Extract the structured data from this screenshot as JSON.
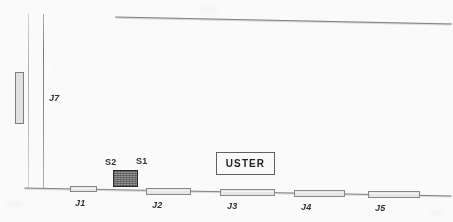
{
  "diagram": {
    "type": "schematic-line-drawing",
    "media": "scanned-fax-document",
    "background_color": "#fefefe",
    "stroke_color": "#3a3a3a",
    "bar_fill_color": "#e9e9e9",
    "dark_box_fill_color": "#7e7e7e",
    "callout": {
      "label": "USTER",
      "x": 216,
      "y": 152,
      "width": 59,
      "height": 23
    },
    "baseline": {
      "name": "ground-baseline",
      "x1": 24,
      "y1": 188,
      "x2": 452,
      "y2": 196
    },
    "top_rule": {
      "name": "upper-boundary-line",
      "x1": 115,
      "y1": 17,
      "x2": 452,
      "y2": 24
    },
    "vertical_lines": [
      {
        "name": "left-vertical-faint",
        "x": 28,
        "y1": 14,
        "y2": 188,
        "weight": "faint"
      },
      {
        "name": "left-vertical-main",
        "x": 43,
        "y1": 14,
        "y2": 188,
        "weight": "main"
      }
    ],
    "vertical_bars": [
      {
        "label": "J7-riser",
        "x": 15,
        "y": 72,
        "width": 9,
        "height": 52
      }
    ],
    "horizontal_bars": [
      {
        "label": "J1",
        "x": 70,
        "y": 186,
        "width": 27,
        "height": 6
      },
      {
        "label": "J2",
        "x": 146,
        "y": 188,
        "width": 45,
        "height": 7
      },
      {
        "label": "J3",
        "x": 220,
        "y": 189,
        "width": 55,
        "height": 7
      },
      {
        "label": "J4",
        "x": 294,
        "y": 190,
        "width": 51,
        "height": 7
      },
      {
        "label": "J5",
        "x": 368,
        "y": 191,
        "width": 52,
        "height": 7
      }
    ],
    "dark_box": {
      "name": "sensor-block",
      "x": 113,
      "y": 170,
      "width": 25,
      "height": 17
    },
    "labels": [
      {
        "id": "label-j7",
        "text": "J7",
        "x": 49,
        "y": 94,
        "style": "slanted"
      },
      {
        "id": "label-s2",
        "text": "S2",
        "x": 105,
        "y": 158,
        "style": "upright"
      },
      {
        "id": "label-s1",
        "text": "S1",
        "x": 136,
        "y": 157,
        "style": "upright"
      },
      {
        "id": "label-j1",
        "text": "J1",
        "x": 75,
        "y": 199,
        "style": "slanted"
      },
      {
        "id": "label-j2",
        "text": "J2",
        "x": 152,
        "y": 201,
        "style": "slanted"
      },
      {
        "id": "label-j3",
        "text": "J3",
        "x": 227,
        "y": 202,
        "style": "slanted"
      },
      {
        "id": "label-j4",
        "text": "J4",
        "x": 301,
        "y": 203,
        "style": "slanted"
      },
      {
        "id": "label-j5",
        "text": "J5",
        "x": 375,
        "y": 204,
        "style": "slanted"
      }
    ]
  }
}
